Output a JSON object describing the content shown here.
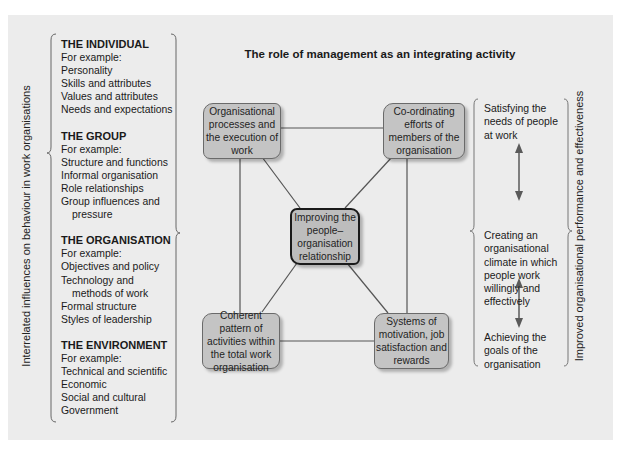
{
  "title": "The role of management as an integrating activity",
  "left_axis_label": "Interrelated influences on behaviour in work organisations",
  "right_axis_label": "Improved organisational performance and effectiveness",
  "influences": [
    {
      "heading": "THE INDIVIDUAL",
      "intro": "For example:",
      "items": [
        "Personality",
        "Skills and attributes",
        "Values and attributes",
        "Needs and expectations"
      ]
    },
    {
      "heading": "THE GROUP",
      "intro": "For example:",
      "items": [
        "Structure and functions",
        "Informal organisation",
        "Role relationships",
        "Group influences and",
        "pressure"
      ]
    },
    {
      "heading": "THE ORGANISATION",
      "intro": "For example:",
      "items": [
        "Objectives and policy",
        "Technology and",
        "methods of work",
        "Formal structure",
        "Styles of leadership"
      ]
    },
    {
      "heading": "THE ENVIRONMENT",
      "intro": "For example:",
      "items": [
        "Technical and scientific",
        "Economic",
        "Social and cultural",
        "Government"
      ]
    }
  ],
  "nodes": {
    "top_left": "Organisational processes and the execution of work",
    "top_right": "Co-ordinating efforts of members of the organisation",
    "center": "Improving the people– organisation relationship",
    "bottom_left": "Coherent pattern of activities within the total work organisation",
    "bottom_right": "Systems of motivation, job satisfaction and rewards"
  },
  "outcomes": {
    "top": "Satisfying the needs of people at work",
    "middle": "Creating an organisational climate in which people work willingly and effectively",
    "bottom": "Achieving the goals of the organisation"
  },
  "colors": {
    "panel_bg": "#ececec",
    "node_fill": "#c4c4c4",
    "line": "#555555",
    "arrow": "#5a5a5a"
  }
}
